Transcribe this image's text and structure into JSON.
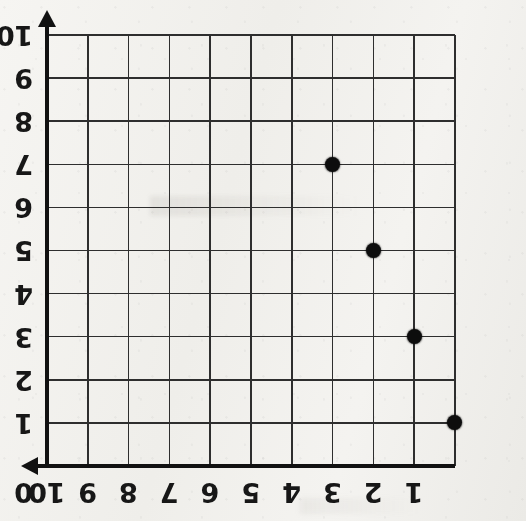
{
  "figure": {
    "kind": "coordinate-grid-scatter",
    "orientation_note": "sheet-rotated-180",
    "background_color": "#f3f2ef",
    "ink_color": "#111111",
    "grid_color": "#2e2e2e",
    "point_color": "#0d0d0d"
  },
  "axes": {
    "origin_label": "0",
    "x_axis": {
      "name": "horizontal-axis",
      "ticks": [
        "1",
        "2",
        "3",
        "4",
        "5",
        "6",
        "7",
        "8",
        "9",
        "10"
      ],
      "min": 0,
      "max": 10,
      "arrow": "arrow-head"
    },
    "y_axis": {
      "name": "vertical-axis",
      "ticks": [
        "1",
        "2",
        "3",
        "4",
        "5",
        "6",
        "7",
        "8",
        "9",
        "10"
      ],
      "min": 0,
      "max": 10,
      "arrow": "arrow-head"
    }
  },
  "chart_data": {
    "type": "scatter",
    "title": "",
    "xlabel": "",
    "ylabel": "",
    "xlim": [
      0,
      10
    ],
    "ylim": [
      0,
      10
    ],
    "grid": true,
    "legend": "none",
    "x": [
      0,
      1,
      2,
      3
    ],
    "y": [
      1,
      3,
      5,
      7
    ],
    "points": [
      {
        "label": "(0, 1)",
        "x": 0,
        "y": 1
      },
      {
        "label": "(1, 3)",
        "x": 1,
        "y": 3
      },
      {
        "label": "(2, 5)",
        "x": 2,
        "y": 5
      },
      {
        "label": "(3, 7)",
        "x": 3,
        "y": 7
      }
    ]
  }
}
